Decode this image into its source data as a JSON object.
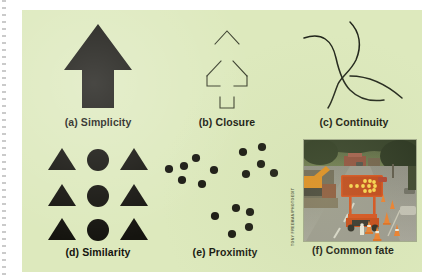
{
  "figure": {
    "background_color": "#dde9bd",
    "ink_color": "#15140f",
    "panels": [
      {
        "id": "simplicity",
        "label": "(a) Simplicity",
        "shape": "solid-filled-up-arrow",
        "description": "A single solid black upward-pointing arrow"
      },
      {
        "id": "closure",
        "label": "(b) Closure",
        "shape": "outline-up-arrow-with-gaps",
        "description": "Outline of an upward arrow drawn with broken line segments separated by gaps"
      },
      {
        "id": "continuity",
        "label": "(c) Continuity",
        "shape": "two-crossing-curves",
        "description": "Two smooth curved lines crossing each other"
      },
      {
        "id": "similarity",
        "label": "(d) Similarity",
        "shape": "grid-of-triangles-and-circles",
        "description": "Three rows each containing triangle, circle, triangle",
        "grid": [
          [
            "triangle",
            "circle",
            "triangle"
          ],
          [
            "triangle",
            "circle",
            "triangle"
          ],
          [
            "triangle",
            "circle",
            "triangle"
          ]
        ]
      },
      {
        "id": "proximity",
        "label": "(e) Proximity",
        "shape": "three-dot-clusters",
        "description": "Black dots arranged into three separated clusters",
        "clusters": [
          {
            "name": "upper-left-cluster",
            "dots": [
              {
                "x": 7,
                "y": 27
              },
              {
                "x": 22,
                "y": 24
              },
              {
                "x": 20,
                "y": 38
              },
              {
                "x": 34,
                "y": 16
              },
              {
                "x": 40,
                "y": 42
              },
              {
                "x": 52,
                "y": 28
              }
            ]
          },
          {
            "name": "upper-right-cluster",
            "dots": [
              {
                "x": 81,
                "y": 10
              },
              {
                "x": 100,
                "y": 5
              },
              {
                "x": 99,
                "y": 22
              },
              {
                "x": 84,
                "y": 32
              },
              {
                "x": 112,
                "y": 31
              }
            ]
          },
          {
            "name": "lower-center-cluster",
            "dots": [
              {
                "x": 53,
                "y": 74
              },
              {
                "x": 74,
                "y": 66
              },
              {
                "x": 88,
                "y": 70
              },
              {
                "x": 87,
                "y": 85
              },
              {
                "x": 70,
                "y": 92
              }
            ]
          }
        ]
      },
      {
        "id": "common-fate",
        "label": "(f) Common fate",
        "shape": "photograph",
        "description": "Photograph of a road construction zone with a lighted arrow board trailer, traffic cones and an excavator beside a street",
        "credit": "TONY FREEMAN/PHOTOEDIT"
      }
    ]
  }
}
